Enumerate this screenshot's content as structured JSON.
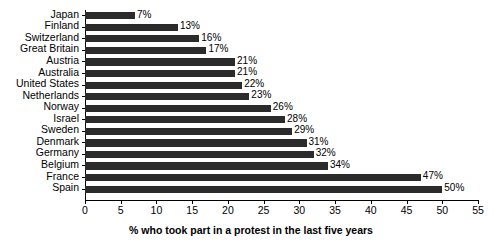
{
  "chart_data": {
    "type": "bar",
    "orientation": "horizontal",
    "title": "",
    "xlabel": "% who took part in a protest in the last five years",
    "ylabel": "",
    "xlim": [
      0,
      55
    ],
    "xticks": [
      0,
      5,
      10,
      15,
      20,
      25,
      30,
      35,
      40,
      45,
      50,
      55
    ],
    "xtick_labels": [
      "0",
      "5",
      "10",
      "15",
      "20",
      "25",
      "30",
      "35",
      "40",
      "45",
      "50",
      "55"
    ],
    "grid": false,
    "legend": null,
    "bar_color": "#2b2b2b",
    "categories": [
      "Japan",
      "Finland",
      "Switzerland",
      "Great Britain",
      "Austria",
      "Australia",
      "United States",
      "Netherlands",
      "Norway",
      "Israel",
      "Sweden",
      "Denmark",
      "Germany",
      "Belgium",
      "France",
      "Spain"
    ],
    "values": [
      7,
      13,
      16,
      17,
      21,
      21,
      22,
      23,
      26,
      28,
      29,
      31,
      32,
      34,
      47,
      50
    ],
    "value_labels": [
      "7%",
      "13%",
      "16%",
      "17%",
      "21%",
      "21%",
      "22%",
      "23%",
      "26%",
      "28%",
      "29%",
      "31%",
      "32%",
      "34%",
      "47%",
      "50%"
    ]
  }
}
